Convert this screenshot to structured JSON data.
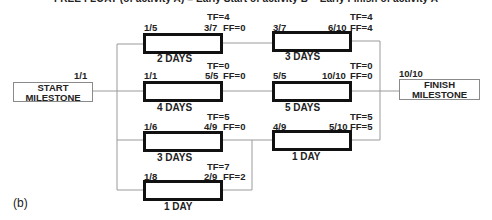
{
  "caption_top": "FREE FLOAT (of activity A) = Early Start of activity B − Early Finish of activity A",
  "figure_label": "(b)",
  "milestones": {
    "start": {
      "label_line1": "START",
      "label_line2": "MILESTONE",
      "date": "1/1"
    },
    "finish": {
      "label_line1": "FINISH",
      "label_line2": "MILESTONE",
      "date": "10/10"
    }
  },
  "activities": [
    {
      "id": "a1",
      "start": "1/5",
      "finish": "3/7",
      "tf": "TF=4",
      "ff": "FF=0",
      "duration": "2 DAYS"
    },
    {
      "id": "a2",
      "start": "3/7",
      "finish": "6/10",
      "tf": "TF=4",
      "ff": "FF=4",
      "duration": "3 DAYS"
    },
    {
      "id": "a3",
      "start": "1/1",
      "finish": "5/5",
      "tf": "TF=0",
      "ff": "FF=0",
      "duration": "4 DAYS"
    },
    {
      "id": "a4",
      "start": "5/5",
      "finish": "10/10",
      "tf": "TF=0",
      "ff": "FF=0",
      "duration": "5 DAYS"
    },
    {
      "id": "a5",
      "start": "1/6",
      "finish": "4/9",
      "tf": "TF=5",
      "ff": "FF=0",
      "duration": "3 DAYS"
    },
    {
      "id": "a6",
      "start": "4/9",
      "finish": "5/10",
      "tf": "TF=5",
      "ff": "FF=5",
      "duration": "1 DAY"
    },
    {
      "id": "a7",
      "start": "1/8",
      "finish": "2/9",
      "tf": "TF=7",
      "ff": "FF=2",
      "duration": "1 DAY"
    }
  ],
  "colors": {
    "activity_border": "#111111",
    "milestone_border": "#8a8a8a",
    "connector": "#9a9a9a"
  }
}
